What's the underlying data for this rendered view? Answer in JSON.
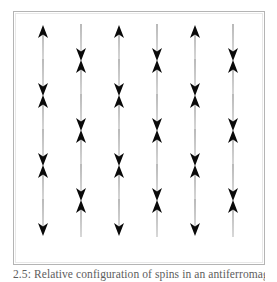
{
  "figure": {
    "name": "antiferromagnetic-spin-lattice",
    "caption": "2.5: Relative configuration of spins in an antiferromagnet",
    "frame": {
      "border_color": "#b4b4b4",
      "background": "#ffffff"
    },
    "lattice": {
      "columns": 6,
      "rows": 6,
      "column_x": [
        42,
        80,
        118,
        156,
        194,
        232
      ],
      "row_y": [
        42,
        77,
        112,
        147,
        182,
        217
      ],
      "pattern_description": "checkerboard alternating up and down spins",
      "cells": [
        {
          "col": 0,
          "row": 0,
          "direction": "up"
        },
        {
          "col": 1,
          "row": 0,
          "direction": "down"
        },
        {
          "col": 2,
          "row": 0,
          "direction": "up"
        },
        {
          "col": 3,
          "row": 0,
          "direction": "down"
        },
        {
          "col": 4,
          "row": 0,
          "direction": "up"
        },
        {
          "col": 5,
          "row": 0,
          "direction": "down"
        },
        {
          "col": 0,
          "row": 1,
          "direction": "down"
        },
        {
          "col": 1,
          "row": 1,
          "direction": "up"
        },
        {
          "col": 2,
          "row": 1,
          "direction": "down"
        },
        {
          "col": 3,
          "row": 1,
          "direction": "up"
        },
        {
          "col": 4,
          "row": 1,
          "direction": "down"
        },
        {
          "col": 5,
          "row": 1,
          "direction": "up"
        },
        {
          "col": 0,
          "row": 2,
          "direction": "up"
        },
        {
          "col": 1,
          "row": 2,
          "direction": "down"
        },
        {
          "col": 2,
          "row": 2,
          "direction": "up"
        },
        {
          "col": 3,
          "row": 2,
          "direction": "down"
        },
        {
          "col": 4,
          "row": 2,
          "direction": "up"
        },
        {
          "col": 5,
          "row": 2,
          "direction": "down"
        },
        {
          "col": 0,
          "row": 3,
          "direction": "down"
        },
        {
          "col": 1,
          "row": 3,
          "direction": "up"
        },
        {
          "col": 2,
          "row": 3,
          "direction": "down"
        },
        {
          "col": 3,
          "row": 3,
          "direction": "up"
        },
        {
          "col": 4,
          "row": 3,
          "direction": "down"
        },
        {
          "col": 5,
          "row": 3,
          "direction": "up"
        },
        {
          "col": 0,
          "row": 4,
          "direction": "up"
        },
        {
          "col": 1,
          "row": 4,
          "direction": "down"
        },
        {
          "col": 2,
          "row": 4,
          "direction": "up"
        },
        {
          "col": 3,
          "row": 4,
          "direction": "down"
        },
        {
          "col": 4,
          "row": 4,
          "direction": "up"
        },
        {
          "col": 5,
          "row": 4,
          "direction": "down"
        },
        {
          "col": 0,
          "row": 5,
          "direction": "down"
        },
        {
          "col": 1,
          "row": 5,
          "direction": "up"
        },
        {
          "col": 2,
          "row": 5,
          "direction": "down"
        },
        {
          "col": 3,
          "row": 5,
          "direction": "up"
        },
        {
          "col": 4,
          "row": 5,
          "direction": "down"
        },
        {
          "col": 5,
          "row": 5,
          "direction": "up"
        }
      ],
      "arrow_style": {
        "shaft_color_top": "#b9b9b9",
        "shaft_color_bottom": "#d8d8d8",
        "head_color": "#0a0a0a",
        "shaft_width_px": 2,
        "arrow_height_px": 38
      }
    }
  }
}
